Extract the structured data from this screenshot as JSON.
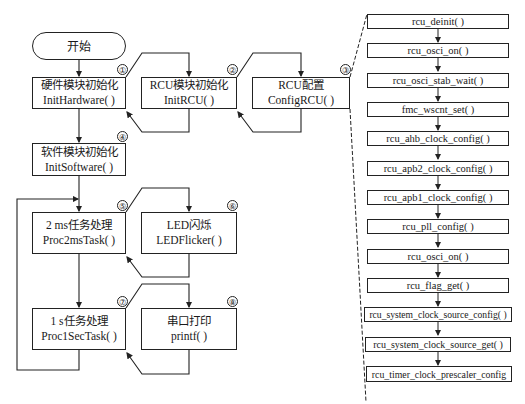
{
  "start": {
    "label": "开始"
  },
  "steps": [
    {
      "id": "1",
      "marker": "1",
      "title": "硬件模块初始化",
      "func": "InitHardware( )"
    },
    {
      "id": "2",
      "marker": "2",
      "title": "RCU模块初始化",
      "func": "InitRCU( )"
    },
    {
      "id": "3",
      "marker": "3",
      "title": "RCU配置",
      "func": "ConfigRCU( )"
    },
    {
      "id": "4",
      "marker": "4",
      "title": "软件模块初始化",
      "func": "InitSoftware( )"
    },
    {
      "id": "5",
      "marker": "5",
      "title": "2 ms任务处理",
      "func": "Proc2msTask( )"
    },
    {
      "id": "6",
      "marker": "6",
      "title": "LED闪烁",
      "func": "LEDFlicker( )"
    },
    {
      "id": "7",
      "marker": "7",
      "title": "1 s任务处理",
      "func": "Proc1SecTask( )"
    },
    {
      "id": "8",
      "marker": "8",
      "title": "串口打印",
      "func": "printf( )"
    }
  ],
  "rcu_sequence": [
    "rcu_deinit( )",
    "rcu_osci_on( )",
    "rcu_osci_stab_wait( )",
    "fmc_wscnt_set( )",
    "rcu_ahb_clock_config( )",
    "rcu_apb2_clock_config( )",
    "rcu_apb1_clock_config( )",
    "rcu_pll_config( )",
    "rcu_osci_on( )",
    "rcu_flag_get( )",
    "rcu_system_clock_source_config( )",
    "rcu_system_clock_source_get( )",
    "rcu_timer_clock_prescaler_config"
  ],
  "markers": [
    "①",
    "②",
    "③",
    "④",
    "⑤",
    "⑥",
    "⑦",
    "⑧"
  ]
}
